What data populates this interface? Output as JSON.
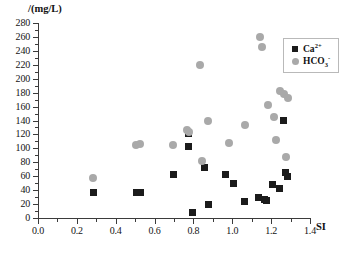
{
  "chart_data": {
    "type": "scatter",
    "title": "",
    "xlabel": "SI",
    "ylabel": "/(mg/L)",
    "xlim": [
      0.0,
      1.4
    ],
    "ylim": [
      0,
      280
    ],
    "xticks": [
      "0.0",
      "0.2",
      "0.4",
      "0.6",
      "0.8",
      "1.0",
      "1.2",
      "1.4"
    ],
    "xtick_values": [
      0.0,
      0.2,
      0.4,
      0.6,
      0.8,
      1.0,
      1.2,
      1.4
    ],
    "yticks": [
      "0",
      "20",
      "40",
      "60",
      "80",
      "100",
      "120",
      "140",
      "160",
      "180",
      "200",
      "220",
      "240",
      "260",
      "280"
    ],
    "ytick_values": [
      0,
      20,
      40,
      60,
      80,
      100,
      120,
      140,
      160,
      180,
      200,
      220,
      240,
      260,
      280
    ],
    "grid": false,
    "legend_position": "top-right",
    "series": [
      {
        "name": "Ca2+",
        "label": "Ca",
        "label_sup": "2+",
        "label_sub": "",
        "marker": "square",
        "color": "#1b1b1b",
        "points": [
          [
            0.285,
            36
          ],
          [
            0.505,
            37
          ],
          [
            0.525,
            37
          ],
          [
            0.695,
            62
          ],
          [
            0.775,
            122
          ],
          [
            0.775,
            103
          ],
          [
            0.795,
            8
          ],
          [
            0.855,
            72
          ],
          [
            0.875,
            20
          ],
          [
            0.965,
            62
          ],
          [
            1.005,
            50
          ],
          [
            1.065,
            24
          ],
          [
            1.135,
            30
          ],
          [
            1.165,
            27
          ],
          [
            1.175,
            25
          ],
          [
            1.205,
            48
          ],
          [
            1.245,
            42
          ],
          [
            1.265,
            140
          ],
          [
            1.275,
            65
          ],
          [
            1.285,
            60
          ]
        ]
      },
      {
        "name": "HCO3-",
        "label": "HCO",
        "label_sub": "3",
        "label_sup": "-",
        "marker": "circle",
        "color": "#a9a9a9",
        "points": [
          [
            0.285,
            58
          ],
          [
            0.505,
            105
          ],
          [
            0.525,
            106
          ],
          [
            0.695,
            105
          ],
          [
            0.765,
            127
          ],
          [
            0.775,
            124
          ],
          [
            0.835,
            220
          ],
          [
            0.845,
            82
          ],
          [
            0.875,
            140
          ],
          [
            0.985,
            107
          ],
          [
            1.065,
            133
          ],
          [
            1.145,
            260
          ],
          [
            1.155,
            245
          ],
          [
            1.185,
            162
          ],
          [
            1.215,
            145
          ],
          [
            1.225,
            112
          ],
          [
            1.245,
            182
          ],
          [
            1.265,
            178
          ],
          [
            1.275,
            88
          ],
          [
            1.285,
            172
          ]
        ]
      }
    ]
  }
}
